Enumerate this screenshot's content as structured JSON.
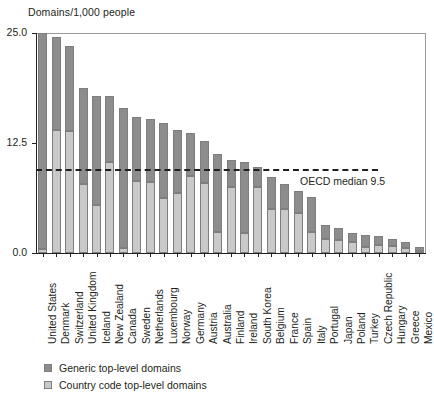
{
  "chart_data": {
    "type": "bar",
    "stacked": true,
    "title": "",
    "ylabel": "Domains/1,000 people",
    "xlabel": "",
    "ylim": [
      0,
      25
    ],
    "yticks": [
      0,
      12.5,
      25
    ],
    "ytick_labels": [
      "0.0",
      "12.5",
      "25.0"
    ],
    "grid": false,
    "legend_position": "below-axis-left",
    "categories": [
      "United States",
      "Denmark",
      "Switzerland",
      "United Kingdom",
      "Iceland",
      "New Zealand",
      "Canada",
      "Sweden",
      "Netherlands",
      "Luxembourg",
      "Norway",
      "Germany",
      "Austria",
      "Australia",
      "Finland",
      "Ireland",
      "South Korea",
      "Belgium",
      "France",
      "Spain",
      "Italy",
      "Portugal",
      "Japan",
      "Poland",
      "Turkey",
      "Czech Republic",
      "Hungary",
      "Greece",
      "Mexico"
    ],
    "series": [
      {
        "name": "Generic top-level domains",
        "color": "#8d8d8d",
        "values": [
          24.6,
          10.6,
          9.6,
          11.0,
          12.3,
          7.5,
          15.9,
          7.3,
          7.1,
          8.5,
          7.2,
          4.8,
          4.7,
          8.9,
          3.1,
          8.0,
          2.3,
          3.6,
          2.8,
          2.5,
          4.0,
          1.6,
          1.3,
          1.0,
          1.3,
          1.0,
          0.8,
          0.6,
          0.5
        ]
      },
      {
        "name": "Country code top-level domains",
        "color": "#c9c9c9",
        "values": [
          0.4,
          14.0,
          13.9,
          7.8,
          5.5,
          10.3,
          0.6,
          8.2,
          8.1,
          6.3,
          6.8,
          8.8,
          8.0,
          2.4,
          7.5,
          2.3,
          7.5,
          5.0,
          5.0,
          4.5,
          2.4,
          1.6,
          1.5,
          1.3,
          0.7,
          0.9,
          0.8,
          0.6,
          0.2
        ]
      }
    ],
    "totals": [
      25.0,
      24.6,
      23.5,
      18.8,
      17.8,
      17.8,
      16.5,
      15.5,
      15.2,
      14.8,
      14.0,
      13.6,
      12.7,
      11.3,
      10.6,
      10.3,
      9.8,
      8.6,
      7.8,
      7.0,
      6.4,
      3.2,
      2.8,
      2.3,
      2.0,
      1.9,
      1.6,
      1.2,
      0.7
    ],
    "annotations": [
      {
        "label": "OECD median 9.5",
        "type": "hline",
        "value": 9.5,
        "style": "dashed"
      }
    ]
  },
  "legend": {
    "items": [
      {
        "label": "Generic top-level domains"
      },
      {
        "label": "Country code top-level domains"
      }
    ]
  },
  "colors": {
    "generic": "#8d8d8d",
    "country_code": "#c9c9c9",
    "axis": "#231f20",
    "background": "#ffffff"
  }
}
